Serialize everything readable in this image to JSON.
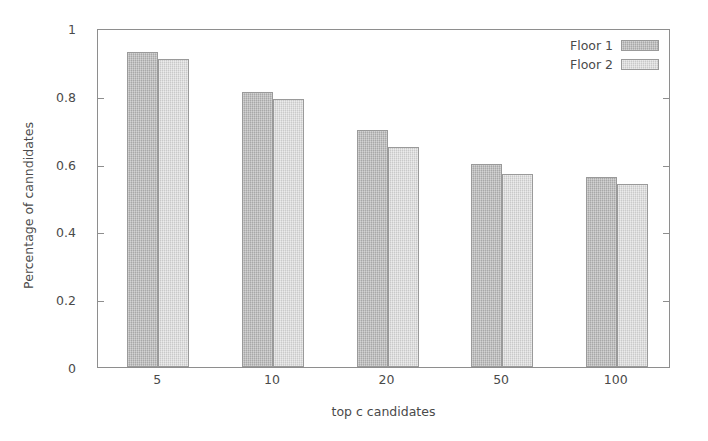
{
  "chart_data": {
    "type": "bar",
    "title": "",
    "subtitle": "",
    "xlabel": "top c candidates",
    "ylabel": "Percentage of canndidates",
    "categories": [
      "5",
      "10",
      "20",
      "50",
      "100"
    ],
    "series": [
      {
        "name": "Floor 1",
        "color": "#b9b9b9",
        "values": [
          0.93,
          0.81,
          0.7,
          0.6,
          0.56
        ]
      },
      {
        "name": "Floor 2",
        "color": "#d9d9d9",
        "values": [
          0.91,
          0.79,
          0.65,
          0.57,
          0.54
        ]
      }
    ],
    "ylim": [
      0,
      1
    ],
    "yticks": [
      "0",
      "0.2",
      "0.4",
      "0.6",
      "0.8",
      "1"
    ],
    "ytick_values": [
      0,
      0.2,
      0.4,
      0.6,
      0.8,
      1
    ],
    "grid": false,
    "legend_position": "top-right",
    "frame_color": "#8e8e8e",
    "background": "#ffffff"
  }
}
